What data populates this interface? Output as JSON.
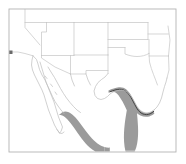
{
  "figure": {
    "title": "Southwestern United States and Northern Mexico reference map",
    "type": "reference-map",
    "width": 186,
    "height": 164,
    "background_color": "#ffffff"
  },
  "frame": {
    "name": "map-frame",
    "stroke_color": "#b3b3b3",
    "stroke_width": 0.9,
    "x": 9,
    "y": 9,
    "width": 167,
    "height": 143
  },
  "styles": {
    "boundary_color": "#c4c4c4",
    "boundary_width": 0.7,
    "coastline_color": "#bdbdbd",
    "shaded_region_fill": "#9b9b9b",
    "shaded_region_fill_light": "#a8a8a8",
    "route_line_color": "#3a3a3a",
    "route_line_width": 0.9
  },
  "regions": {
    "shaded": [
      {
        "name": "gulf-coast-shaded-band",
        "label": "Texas Gulf coastal band",
        "fill": "#9b9b9b"
      },
      {
        "name": "pacific-coast-shaded-band",
        "label": "Mexico Pacific coastal band",
        "fill": "#9b9b9b"
      }
    ],
    "route": {
      "name": "coastal-route-line",
      "label": "Dark coastal trace line",
      "color": "#3a3a3a"
    }
  },
  "boundaries": {
    "state_lines_label": "US state boundaries",
    "coastlines_label": "Coastlines and peninsulas",
    "count_visible_states": 12
  },
  "landmarks": {
    "baja_peninsula": "Baja California peninsula",
    "gulf_of_california": "Gulf of California",
    "texas_outline": "Texas state outline",
    "rio_grande": "Rio Grande border"
  }
}
